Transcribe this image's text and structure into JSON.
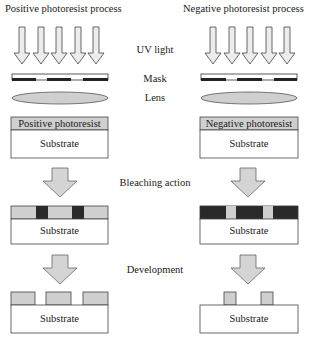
{
  "diagram": {
    "columns": {
      "left": {
        "title": "Positive photoresist process",
        "resist_label": "Positive photoresist"
      },
      "right": {
        "title": "Negative photoresist process",
        "resist_label": "Negative photoresist"
      }
    },
    "stage_labels": {
      "uv": "UV light",
      "mask": "Mask",
      "lens": "Lens",
      "bleaching": "Bleaching action",
      "development": "Development"
    },
    "substrate_label": "Substrate",
    "colors": {
      "resist_fill": "#cfcfcf",
      "exposed_dark": "#2a2a2a",
      "outline": "#333333",
      "arrow_fill": "#d4d4d4"
    },
    "steps": [
      "UV exposure through mask and lens",
      "Bleaching action",
      "Development"
    ]
  }
}
